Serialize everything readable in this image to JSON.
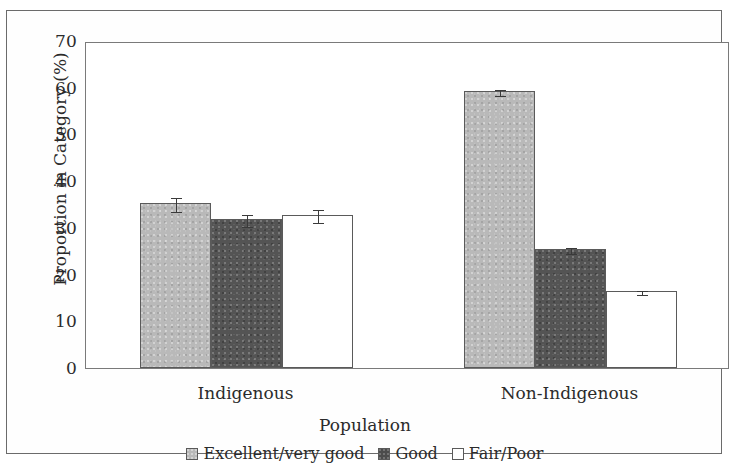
{
  "chart_data": {
    "type": "bar",
    "title": "",
    "subtitle": "",
    "xlabel": "Population",
    "ylabel": "Proportion in Category (%)",
    "categories": [
      "Indigenous",
      "Non-Indigenous"
    ],
    "ylim": [
      0,
      70
    ],
    "yticks": [
      0,
      10,
      20,
      30,
      40,
      50,
      60,
      70
    ],
    "ytick_labels": [
      "0",
      "10",
      "20",
      "30",
      "40",
      "50",
      "60",
      "70"
    ],
    "grid": false,
    "legend_position": "bottom",
    "error_bars": true,
    "series": [
      {
        "name": "Excellent/very good",
        "color": "#b9b9b9",
        "values": [
          35.3,
          59.3
        ],
        "errors": [
          1.5,
          0.7
        ]
      },
      {
        "name": "Good",
        "color": "#545454",
        "values": [
          31.9,
          25.5
        ],
        "errors": [
          1.3,
          0.7
        ]
      },
      {
        "name": "Fair/Poor",
        "color": "#ffffff",
        "values": [
          32.8,
          16.5
        ],
        "errors": [
          1.4,
          0.4
        ]
      }
    ]
  },
  "axes": {
    "y_title": "Proportion in Category (%)",
    "x_title": "Population"
  },
  "legend": {
    "items": [
      {
        "label": "Excellent/very good",
        "swatch": "light"
      },
      {
        "label": "Good",
        "swatch": "dark"
      },
      {
        "label": "Fair/Poor",
        "swatch": "white"
      }
    ]
  }
}
